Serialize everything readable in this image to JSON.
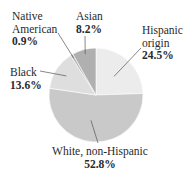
{
  "chart_data": {
    "type": "pie",
    "title": "",
    "start_angle_deg": 0,
    "direction": "clockwise",
    "slices": [
      {
        "label": "Hispanic origin",
        "value": 24.5,
        "value_label": "24.5%",
        "color": "#ececec"
      },
      {
        "label": "White, non-Hispanic",
        "value": 52.8,
        "value_label": "52.8%",
        "color": "#c9c9c9"
      },
      {
        "label": "Black",
        "value": 13.6,
        "value_label": "13.6%",
        "color": "#dedede"
      },
      {
        "label": "Native American",
        "value": 0.9,
        "value_label": "0.9%",
        "color": "#b5b5b5"
      },
      {
        "label": "Asian",
        "value": 8.2,
        "value_label": "8.2%",
        "color": "#b0b0b0"
      }
    ],
    "categories": [
      "Hispanic origin",
      "White, non-Hispanic",
      "Black",
      "Native American",
      "Asian"
    ],
    "values": [
      24.5,
      52.8,
      13.6,
      0.9,
      8.2
    ],
    "unit": "%"
  },
  "labels": {
    "native_american": {
      "line1": "Native",
      "line2": "American",
      "pct": "0.9%"
    },
    "asian": {
      "name": "Asian",
      "pct": "8.2%"
    },
    "hispanic": {
      "line1": "Hispanic",
      "line2": "origin",
      "pct": "24.5%"
    },
    "black": {
      "name": "Black",
      "pct": "13.6%"
    },
    "white": {
      "name": "White, non-Hispanic",
      "pct": "52.8%"
    }
  },
  "colors": {
    "leader_line": "#555555",
    "slice_border": "#ffffff"
  }
}
